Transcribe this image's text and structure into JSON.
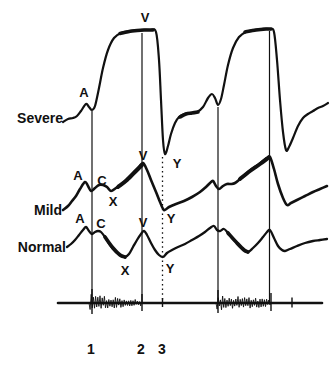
{
  "figure": {
    "width": 330,
    "height": 368,
    "ink": "#111111",
    "background": "#ffffff"
  },
  "row_labels": [
    {
      "id": "severe",
      "label": "Severe",
      "x": 63,
      "y": 123
    },
    {
      "id": "mild",
      "label": "Mild",
      "x": 62,
      "y": 215
    },
    {
      "id": "normal",
      "label": "Normal",
      "x": 66,
      "y": 252
    }
  ],
  "traces": [
    {
      "id": "severe",
      "stroke_width": 2.2,
      "points": [
        [
          63,
          122
        ],
        [
          68,
          119
        ],
        [
          73,
          118
        ],
        [
          77,
          116
        ],
        [
          81,
          111
        ],
        [
          86,
          104
        ],
        [
          89,
          107
        ],
        [
          92,
          110
        ],
        [
          95,
          106
        ],
        [
          99,
          88
        ],
        [
          103,
          68
        ],
        [
          108,
          50
        ],
        [
          114,
          38
        ],
        [
          121,
          33
        ],
        [
          130,
          31
        ],
        [
          140,
          30
        ],
        [
          150,
          30
        ],
        [
          156,
          32
        ],
        [
          159,
          60
        ],
        [
          161,
          100
        ],
        [
          163,
          140
        ],
        [
          165,
          154
        ],
        [
          168,
          146
        ],
        [
          171,
          134
        ],
        [
          175,
          123
        ],
        [
          179,
          117
        ],
        [
          184,
          114
        ],
        [
          190,
          113
        ],
        [
          197,
          112
        ],
        [
          203,
          107
        ],
        [
          208,
          98
        ],
        [
          212,
          94
        ],
        [
          215,
          98
        ],
        [
          218,
          105
        ],
        [
          221,
          99
        ],
        [
          224,
          85
        ],
        [
          228,
          65
        ],
        [
          233,
          48
        ],
        [
          239,
          37
        ],
        [
          246,
          32
        ],
        [
          254,
          30
        ],
        [
          262,
          29
        ],
        [
          270,
          29
        ],
        [
          274,
          32
        ],
        [
          277,
          60
        ],
        [
          280,
          100
        ],
        [
          283,
          132
        ],
        [
          286,
          150
        ],
        [
          289,
          147
        ],
        [
          293,
          138
        ],
        [
          298,
          126
        ],
        [
          303,
          118
        ],
        [
          308,
          114
        ],
        [
          313,
          111
        ],
        [
          318,
          108
        ],
        [
          323,
          106
        ],
        [
          328,
          103
        ]
      ],
      "thick_overlays": [
        [
          [
            120,
            33.5
          ],
          [
            132,
            31
          ],
          [
            144,
            30
          ],
          [
            153,
            30
          ]
        ],
        [
          [
            245,
            32
          ],
          [
            256,
            30
          ],
          [
            266,
            29
          ],
          [
            271,
            29
          ]
        ],
        [
          [
            180,
            117
          ],
          [
            186,
            114
          ],
          [
            192,
            113
          ],
          [
            198,
            112
          ]
        ]
      ]
    },
    {
      "id": "mild",
      "stroke_width": 2.6,
      "points": [
        [
          63,
          210
        ],
        [
          68,
          206
        ],
        [
          72,
          201
        ],
        [
          76,
          196
        ],
        [
          80,
          189
        ],
        [
          85,
          182
        ],
        [
          88,
          186
        ],
        [
          91,
          191
        ],
        [
          95,
          188
        ],
        [
          99,
          185
        ],
        [
          103,
          185
        ],
        [
          107,
          187
        ],
        [
          111,
          191
        ],
        [
          116,
          188
        ],
        [
          122,
          184
        ],
        [
          128,
          178
        ],
        [
          134,
          172
        ],
        [
          139,
          167
        ],
        [
          143,
          163
        ],
        [
          147,
          170
        ],
        [
          151,
          180
        ],
        [
          156,
          192
        ],
        [
          160,
          202
        ],
        [
          164,
          210
        ],
        [
          169,
          207
        ],
        [
          176,
          204
        ],
        [
          184,
          201
        ],
        [
          192,
          197
        ],
        [
          200,
          192
        ],
        [
          206,
          187
        ],
        [
          210,
          183
        ],
        [
          213,
          181
        ],
        [
          216,
          186
        ],
        [
          219,
          189
        ],
        [
          223,
          186
        ],
        [
          227,
          184
        ],
        [
          231,
          184
        ],
        [
          235,
          183
        ],
        [
          240,
          179
        ],
        [
          246,
          174
        ],
        [
          252,
          169
        ],
        [
          258,
          165
        ],
        [
          263,
          161
        ],
        [
          267,
          158
        ],
        [
          270,
          157
        ],
        [
          274,
          169
        ],
        [
          278,
          184
        ],
        [
          283,
          198
        ],
        [
          287,
          205
        ],
        [
          291,
          203
        ],
        [
          297,
          200
        ],
        [
          305,
          196
        ],
        [
          313,
          192
        ],
        [
          320,
          189
        ],
        [
          327,
          186
        ]
      ],
      "thick_overlays": [
        [
          [
            118,
            187
          ],
          [
            127,
            180
          ],
          [
            136,
            171
          ],
          [
            142,
            165
          ]
        ],
        [
          [
            240,
            179
          ],
          [
            250,
            171
          ],
          [
            260,
            164
          ],
          [
            268,
            158
          ]
        ]
      ]
    },
    {
      "id": "normal",
      "stroke_width": 2.3,
      "points": [
        [
          67,
          247
        ],
        [
          71,
          244
        ],
        [
          75,
          240
        ],
        [
          79,
          235
        ],
        [
          83,
          230
        ],
        [
          86,
          227
        ],
        [
          89,
          231
        ],
        [
          92,
          234
        ],
        [
          95,
          232
        ],
        [
          98,
          231
        ],
        [
          101,
          232
        ],
        [
          105,
          237
        ],
        [
          110,
          245
        ],
        [
          115,
          251
        ],
        [
          120,
          255
        ],
        [
          125,
          257
        ],
        [
          129,
          254
        ],
        [
          133,
          247
        ],
        [
          137,
          240
        ],
        [
          141,
          234
        ],
        [
          144,
          231
        ],
        [
          147,
          235
        ],
        [
          151,
          243
        ],
        [
          155,
          250
        ],
        [
          159,
          255
        ],
        [
          163,
          257
        ],
        [
          167,
          253
        ],
        [
          172,
          250
        ],
        [
          178,
          247
        ],
        [
          185,
          244
        ],
        [
          192,
          240
        ],
        [
          199,
          236
        ],
        [
          205,
          232
        ],
        [
          210,
          228
        ],
        [
          214,
          226
        ],
        [
          217,
          230
        ],
        [
          220,
          231
        ],
        [
          224,
          229
        ],
        [
          228,
          233
        ],
        [
          233,
          239
        ],
        [
          238,
          244
        ],
        [
          243,
          249
        ],
        [
          248,
          252
        ],
        [
          253,
          248
        ],
        [
          258,
          243
        ],
        [
          263,
          237
        ],
        [
          267,
          232
        ],
        [
          270,
          230
        ],
        [
          274,
          238
        ],
        [
          278,
          246
        ],
        [
          282,
          250
        ],
        [
          285,
          251
        ],
        [
          290,
          249
        ],
        [
          297,
          246
        ],
        [
          305,
          243
        ],
        [
          313,
          241
        ],
        [
          320,
          240
        ],
        [
          327,
          239
        ]
      ],
      "thick_overlays": [
        [
          [
            105,
            237
          ],
          [
            113,
            248
          ],
          [
            120,
            255
          ],
          [
            125,
            257
          ]
        ],
        [
          [
            228,
            233
          ],
          [
            237,
            243
          ],
          [
            244,
            250
          ],
          [
            248,
            252
          ]
        ]
      ]
    }
  ],
  "wave_labels": [
    {
      "trace": "severe",
      "text": "A",
      "x": 84,
      "y": 92
    },
    {
      "trace": "severe",
      "text": "V",
      "x": 145,
      "y": 17
    },
    {
      "trace": "severe",
      "text": "Y",
      "x": 177,
      "y": 163
    },
    {
      "trace": "mild",
      "text": "A",
      "x": 78,
      "y": 175
    },
    {
      "trace": "mild",
      "text": "C",
      "x": 102,
      "y": 180
    },
    {
      "trace": "mild",
      "text": "X",
      "x": 113,
      "y": 201
    },
    {
      "trace": "mild",
      "text": "V",
      "x": 143,
      "y": 155
    },
    {
      "trace": "mild",
      "text": "Y",
      "x": 171,
      "y": 218
    },
    {
      "trace": "normal",
      "text": "A",
      "x": 80,
      "y": 218
    },
    {
      "trace": "normal",
      "text": "C",
      "x": 101,
      "y": 223
    },
    {
      "trace": "normal",
      "text": "V",
      "x": 143,
      "y": 222
    },
    {
      "trace": "normal",
      "text": "X",
      "x": 125,
      "y": 270
    },
    {
      "trace": "normal",
      "text": "Y",
      "x": 170,
      "y": 268
    }
  ],
  "event_lines": [
    {
      "id": "a-wave-line-1",
      "x": 92,
      "y1": 111,
      "y2": 302,
      "style": "solid"
    },
    {
      "id": "v-wave-line-1",
      "x": 142,
      "y1": 33,
      "y2": 302,
      "style": "solid"
    },
    {
      "id": "y-trough-line",
      "x": 162.5,
      "y1": 157,
      "y2": 302,
      "style": "dotted"
    },
    {
      "id": "a-wave-line-2",
      "x": 218,
      "y1": 107,
      "y2": 302,
      "style": "solid"
    },
    {
      "id": "v-wave-line-2",
      "x": 269.5,
      "y1": 31,
      "y2": 302,
      "style": "solid"
    }
  ],
  "phono": {
    "baseline_y": 303,
    "x_start": 58,
    "x_end": 322,
    "baseline_width": 2.6,
    "bursts": [
      {
        "x0": 89,
        "x1": 141,
        "amp_start": 9,
        "amp_end": 3
      },
      {
        "x0": 216,
        "x1": 271,
        "amp_start": 8.5,
        "amp_end": 3.5
      }
    ],
    "spikes": [
      {
        "x": 92,
        "up": 14,
        "down": 11
      },
      {
        "x": 142,
        "up": 9,
        "down": 8
      },
      {
        "x": 162.5,
        "up": 5,
        "down": 4
      },
      {
        "x": 218,
        "up": 13,
        "down": 10
      },
      {
        "x": 271,
        "up": 10,
        "down": 8
      },
      {
        "x": 292,
        "up": 5.5,
        "down": 4.5
      }
    ]
  },
  "beat_numbers": [
    {
      "text": "1",
      "x": 91,
      "y": 349
    },
    {
      "text": "2",
      "x": 141,
      "y": 349
    },
    {
      "text": "3",
      "x": 162,
      "y": 349
    }
  ]
}
